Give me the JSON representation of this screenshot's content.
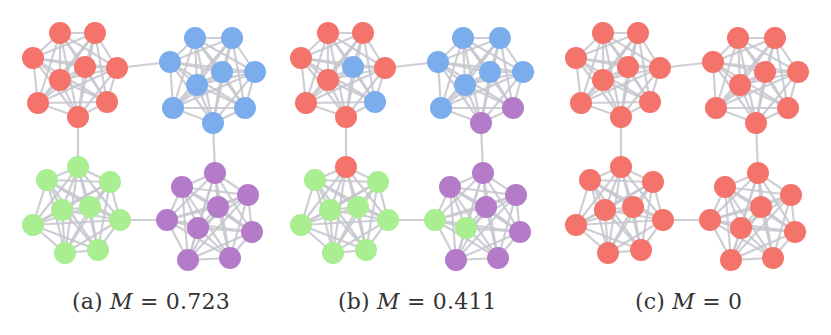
{
  "colors": {
    "red": "#f4736a",
    "blue": "#7bacec",
    "green": "#a9ee90",
    "purple": "#b47bc9",
    "edge": "#c6c6ce"
  },
  "node_radius": 11,
  "base_layout": {
    "clusters": [
      {
        "id": "A",
        "nodes": [
          [
            60,
            33
          ],
          [
            95,
            33
          ],
          [
            33,
            58
          ],
          [
            85,
            67
          ],
          [
            117,
            68
          ],
          [
            60,
            80
          ],
          [
            38,
            103
          ],
          [
            107,
            102
          ],
          [
            78,
            117
          ]
        ]
      },
      {
        "id": "B",
        "nodes": [
          [
            195,
            38
          ],
          [
            232,
            38
          ],
          [
            170,
            62
          ],
          [
            222,
            72
          ],
          [
            255,
            72
          ],
          [
            197,
            85
          ],
          [
            173,
            108
          ],
          [
            245,
            108
          ],
          [
            213,
            123
          ]
        ]
      },
      {
        "id": "C",
        "nodes": [
          [
            78,
            167
          ],
          [
            47,
            180
          ],
          [
            110,
            182
          ],
          [
            62,
            210
          ],
          [
            90,
            207
          ],
          [
            33,
            225
          ],
          [
            120,
            220
          ],
          [
            65,
            253
          ],
          [
            98,
            250
          ]
        ]
      },
      {
        "id": "D",
        "nodes": [
          [
            215,
            173
          ],
          [
            182,
            187
          ],
          [
            248,
            195
          ],
          [
            218,
            207
          ],
          [
            167,
            220
          ],
          [
            198,
            228
          ],
          [
            252,
            232
          ],
          [
            188,
            260
          ],
          [
            230,
            258
          ]
        ]
      }
    ],
    "bridges": [
      [
        [
          0,
          4
        ],
        [
          1,
          2
        ]
      ],
      [
        [
          0,
          8
        ],
        [
          2,
          0
        ]
      ],
      [
        [
          1,
          8
        ],
        [
          3,
          0
        ]
      ],
      [
        [
          2,
          6
        ],
        [
          3,
          4
        ]
      ]
    ]
  },
  "panels": [
    {
      "id": "a",
      "offset_x": 0,
      "caption": {
        "label": "(a)",
        "var": "M",
        "eq": "=",
        "value": "0.723"
      },
      "caption_x": 72,
      "cluster_colors": [
        [
          "red",
          "red",
          "red",
          "red",
          "red",
          "red",
          "red",
          "red",
          "red"
        ],
        [
          "blue",
          "blue",
          "blue",
          "blue",
          "blue",
          "blue",
          "blue",
          "blue",
          "blue"
        ],
        [
          "green",
          "green",
          "green",
          "green",
          "green",
          "green",
          "green",
          "green",
          "green"
        ],
        [
          "purple",
          "purple",
          "purple",
          "purple",
          "purple",
          "purple",
          "purple",
          "purple",
          "purple"
        ]
      ]
    },
    {
      "id": "b",
      "offset_x": 268,
      "caption": {
        "label": "(b)",
        "var": "M",
        "eq": "=",
        "value": "0.411"
      },
      "caption_x": 338,
      "cluster_colors": [
        [
          "red",
          "red",
          "red",
          "blue",
          "red",
          "red",
          "red",
          "blue",
          "red"
        ],
        [
          "blue",
          "blue",
          "blue",
          "blue",
          "blue",
          "blue",
          "blue",
          "purple",
          "purple"
        ],
        [
          "red",
          "green",
          "green",
          "green",
          "green",
          "green",
          "green",
          "green",
          "green"
        ],
        [
          "purple",
          "purple",
          "purple",
          "purple",
          "green",
          "green",
          "purple",
          "purple",
          "purple"
        ]
      ]
    },
    {
      "id": "c",
      "offset_x": 543,
      "caption": {
        "label": "(c)",
        "var": "M",
        "eq": "=",
        "value": "0"
      },
      "caption_x": 635,
      "cluster_colors": [
        [
          "red",
          "red",
          "red",
          "red",
          "red",
          "red",
          "red",
          "red",
          "red"
        ],
        [
          "red",
          "red",
          "red",
          "red",
          "red",
          "red",
          "red",
          "red",
          "red"
        ],
        [
          "red",
          "red",
          "red",
          "red",
          "red",
          "red",
          "red",
          "red",
          "red"
        ],
        [
          "red",
          "red",
          "red",
          "red",
          "red",
          "red",
          "red",
          "red",
          "red"
        ]
      ]
    }
  ],
  "captions": {
    "a": {
      "prefix": "(a)",
      "var": "M",
      "rest": " = 0.723"
    },
    "b": {
      "prefix": "(b)",
      "var": "M",
      "rest": " = 0.411"
    },
    "c": {
      "prefix": "(c)",
      "var": "M",
      "rest": " = 0"
    }
  }
}
